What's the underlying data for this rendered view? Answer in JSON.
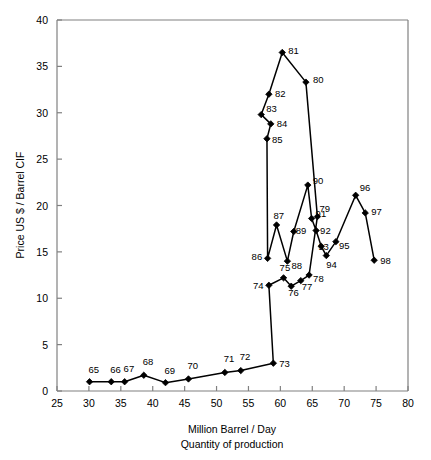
{
  "chart_data": {
    "type": "line",
    "title": "",
    "xlabel": "Million Barrel / Day",
    "xlabel2": "Quantity of production",
    "ylabel": "Price US $ / Barrel CIF",
    "xlim": [
      25,
      80
    ],
    "ylim": [
      0,
      40
    ],
    "xticks": [
      25,
      30,
      35,
      40,
      45,
      50,
      55,
      60,
      65,
      70,
      75,
      80
    ],
    "yticks": [
      0,
      5,
      10,
      15,
      20,
      25,
      30,
      35,
      40
    ],
    "grid": false,
    "legend": "none",
    "marker": "filled-diamond",
    "line_color": "#000000",
    "marker_color": "#000000",
    "axis_color": "#808080",
    "series": [
      {
        "name": "Oil price vs production by year",
        "points": [
          {
            "label": "65",
            "x": 30.1,
            "y": 1.0,
            "lx": -1,
            "ly": -9
          },
          {
            "label": "66",
            "x": 33.5,
            "y": 1.0,
            "lx": -1,
            "ly": -9
          },
          {
            "label": "67",
            "x": 35.6,
            "y": 1.0,
            "lx": -1,
            "ly": -10
          },
          {
            "label": "68",
            "x": 38.6,
            "y": 1.7,
            "lx": -1,
            "ly": -10
          },
          {
            "label": "69",
            "x": 42.0,
            "y": 0.9,
            "lx": -1,
            "ly": -9
          },
          {
            "label": "70",
            "x": 45.6,
            "y": 1.3,
            "lx": -1,
            "ly": -10
          },
          {
            "label": "71",
            "x": 51.3,
            "y": 2.0,
            "lx": -1,
            "ly": -10
          },
          {
            "label": "72",
            "x": 53.8,
            "y": 2.2,
            "lx": -1,
            "ly": -11
          },
          {
            "label": "73",
            "x": 58.9,
            "y": 3.0,
            "lx": 6,
            "ly": 4
          },
          {
            "label": "74",
            "x": 58.2,
            "y": 11.4,
            "lx": -16,
            "ly": 4
          },
          {
            "label": "75",
            "x": 60.5,
            "y": 12.2,
            "lx": -4,
            "ly": -7
          },
          {
            "label": "76",
            "x": 61.7,
            "y": 11.3,
            "lx": -3,
            "ly": 10
          },
          {
            "label": "77",
            "x": 63.2,
            "y": 11.9,
            "lx": 1,
            "ly": 9
          },
          {
            "label": "78",
            "x": 64.5,
            "y": 12.5,
            "lx": 4,
            "ly": 7
          },
          {
            "label": "79",
            "x": 65.8,
            "y": 18.8,
            "lx": 2,
            "ly": -5
          },
          {
            "label": "80",
            "x": 64.0,
            "y": 33.3,
            "lx": 7,
            "ly": 1
          },
          {
            "label": "81",
            "x": 60.3,
            "y": 36.5,
            "lx": 6,
            "ly": 1
          },
          {
            "label": "82",
            "x": 58.2,
            "y": 32.0,
            "lx": 6,
            "ly": 3
          },
          {
            "label": "83",
            "x": 57.0,
            "y": 29.8,
            "lx": 5,
            "ly": -3
          },
          {
            "label": "84",
            "x": 58.5,
            "y": 28.8,
            "lx": 6,
            "ly": 3
          },
          {
            "label": "85",
            "x": 57.9,
            "y": 27.2,
            "lx": 5,
            "ly": 4
          },
          {
            "label": "86",
            "x": 58.0,
            "y": 14.3,
            "lx": -16,
            "ly": 2
          },
          {
            "label": "87",
            "x": 59.4,
            "y": 17.9,
            "lx": -3,
            "ly": -6
          },
          {
            "label": "88",
            "x": 61.1,
            "y": 14.0,
            "lx": 4,
            "ly": 8
          },
          {
            "label": "89",
            "x": 62.1,
            "y": 17.2,
            "lx": 2,
            "ly": 2
          },
          {
            "label": "90",
            "x": 64.3,
            "y": 22.2,
            "lx": 5,
            "ly": -1
          },
          {
            "label": "91",
            "x": 64.9,
            "y": 18.6,
            "lx": 4,
            "ly": -2
          },
          {
            "label": "92",
            "x": 65.6,
            "y": 17.3,
            "lx": 4,
            "ly": 3
          },
          {
            "label": "93",
            "x": 66.4,
            "y": 15.6,
            "lx": -3,
            "ly": 4
          },
          {
            "label": "94",
            "x": 67.2,
            "y": 14.6,
            "lx": 0,
            "ly": 12
          },
          {
            "label": "95",
            "x": 68.7,
            "y": 16.1,
            "lx": 3,
            "ly": 7
          },
          {
            "label": "96",
            "x": 71.8,
            "y": 21.1,
            "lx": 4,
            "ly": -4
          },
          {
            "label": "97",
            "x": 73.3,
            "y": 19.2,
            "lx": 6,
            "ly": 2
          },
          {
            "label": "98",
            "x": 74.7,
            "y": 14.1,
            "lx": 6,
            "ly": 4
          }
        ]
      }
    ]
  }
}
